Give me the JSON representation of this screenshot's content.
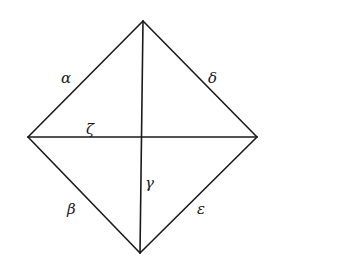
{
  "diagram": {
    "type": "rhombus-with-diagonals",
    "vertices": {
      "top": {
        "x": 143,
        "y": 21
      },
      "left": {
        "x": 28,
        "y": 137
      },
      "right": {
        "x": 257,
        "y": 137
      },
      "bottom": {
        "x": 140,
        "y": 253
      }
    },
    "edges": [
      {
        "id": "alpha",
        "from": "left",
        "to": "top",
        "label": "α",
        "label_pos": {
          "x": 61,
          "y": 83
        }
      },
      {
        "id": "delta",
        "from": "top",
        "to": "right",
        "label": "δ",
        "label_pos": {
          "x": 208,
          "y": 83
        }
      },
      {
        "id": "beta",
        "from": "left",
        "to": "bottom",
        "label": "β",
        "label_pos": {
          "x": 67,
          "y": 214
        }
      },
      {
        "id": "epsilon",
        "from": "bottom",
        "to": "right",
        "label": "ε",
        "label_pos": {
          "x": 197,
          "y": 214
        }
      },
      {
        "id": "zeta",
        "from": "left",
        "to": "right",
        "label": "ζ",
        "label_pos": {
          "x": 86,
          "y": 134
        }
      },
      {
        "id": "gamma",
        "from": "top",
        "to": "bottom",
        "label": "γ",
        "label_pos": {
          "x": 145,
          "y": 188
        }
      }
    ]
  }
}
